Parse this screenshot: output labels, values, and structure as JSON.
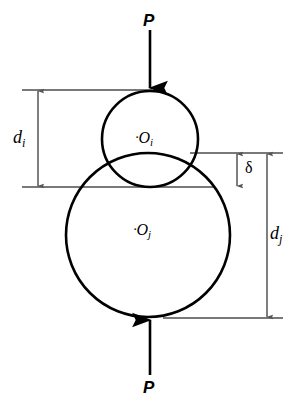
{
  "figure": {
    "type": "engineering-diagram",
    "background_color": "#ffffff",
    "stroke_color": "#000000",
    "extension_line_color": "#4d4d4d"
  },
  "forces": {
    "top": {
      "label": "P",
      "direction": "down",
      "arrow_x": 150,
      "arrow_y_start": 30,
      "arrow_y_end": 90,
      "label_x": 150,
      "label_y": 21
    },
    "bottom": {
      "label": "P",
      "direction": "up",
      "arrow_x": 150,
      "arrow_y_start": 375,
      "arrow_y_end": 318,
      "label_x": 150,
      "label_y": 388
    }
  },
  "circles": [
    {
      "name": "upper-circle",
      "center_label": "O",
      "center_subscript": "i",
      "cx": 150,
      "cy": 139,
      "r": 48,
      "label_x": 146,
      "label_y": 141,
      "center_dot": "·"
    },
    {
      "name": "lower-circle",
      "center_label": "O",
      "center_subscript": "j",
      "cx": 148,
      "cy": 235,
      "r": 82,
      "label_x": 144,
      "label_y": 232,
      "center_dot": "·"
    }
  ],
  "extension_lines": [
    {
      "name": "top-of-upper-circle",
      "x1": 22,
      "x2": 152,
      "y": 90
    },
    {
      "name": "top-of-lower-circle",
      "x1": 190,
      "x2": 283,
      "y": 153
    },
    {
      "name": "bottom-of-upper-circle",
      "x1": 22,
      "x2": 213,
      "y": 187
    },
    {
      "name": "bottom-of-lower-circle",
      "x1": 163,
      "x2": 283,
      "y": 318
    }
  ],
  "dimensions": [
    {
      "name": "di",
      "label": "d",
      "subscript": "i",
      "axis_x": 38,
      "y_top": 90,
      "y_bottom": 187,
      "label_x": 14,
      "label_y": 130,
      "description": "diameter of upper sphere i"
    },
    {
      "name": "delta",
      "label": "δ",
      "subscript": "",
      "axis_x": 237,
      "y_top": 153,
      "y_bottom": 187,
      "label_x": 246,
      "label_y": 161,
      "description": "overlap / approach between spheres"
    },
    {
      "name": "dj",
      "label": "d",
      "subscript": "j",
      "axis_x": 267,
      "y_top": 153,
      "y_bottom": 318,
      "label_x": 272,
      "label_y": 226,
      "description": "diameter of lower sphere j"
    }
  ]
}
